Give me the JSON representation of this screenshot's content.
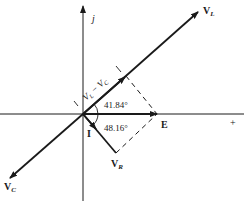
{
  "diagram": {
    "type": "phasor-diagram",
    "axes": {
      "imaginary_label": "j",
      "real_positive_label": "+"
    },
    "phasors": {
      "VL": {
        "label": "V",
        "sub": "L"
      },
      "VC": {
        "label": "V",
        "sub": "C"
      },
      "VR": {
        "label": "V",
        "sub": "R"
      },
      "E": {
        "label": "E"
      },
      "I": {
        "label": "I"
      }
    },
    "difference_label": {
      "a": "V",
      "a_sub": "L",
      "minus": " − ",
      "b": "V",
      "b_sub": "C"
    },
    "angles": {
      "upper": "41.84°",
      "lower": "48.16°"
    },
    "colors": {
      "ink": "#1a1a1a",
      "background": "#ffffff"
    }
  }
}
